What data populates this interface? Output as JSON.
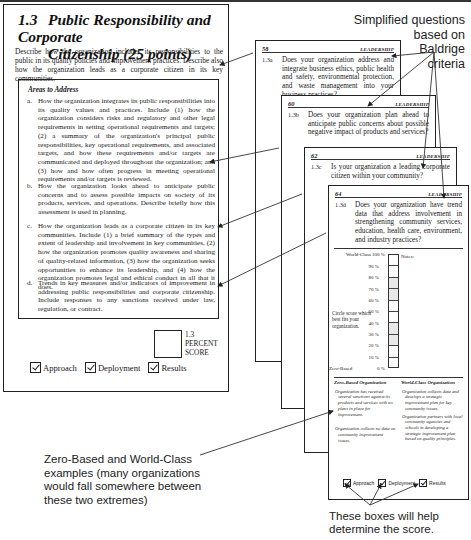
{
  "left_page": {
    "section_number": "1.3",
    "title_line1": "Public Responsibility and Corporate",
    "title_line2": "Citizenship  (25 points)",
    "description": "Describe how the organization includes its responsibilities to the public in its quality policies and improvement practices. Describe also how the organization leads as a corporate citizen in its key communities.",
    "areas_title": "Areas to Address",
    "areas": [
      {
        "letter": "a.",
        "text": "How the organization integrates its public responsibilities into its quality values and practices. Include (1) how the organization considers risks and regulatory and other legal requirements in setting operational requirements and targets; (2) a summary of the organization's principal public responsibilities, key operational requirements, and associated targets, and how these requirements and/or targets are communicated and deployed throughout the organization; and (3) how and how often progress in meeting operational requirements and/or targets is reviewed."
      },
      {
        "letter": "b.",
        "text": "How the organization looks ahead to anticipate public concerns and to assess possible impacts on society of its products, services, and operations. Describe briefly how this assessment is used in planning."
      },
      {
        "letter": "c.",
        "text": "How the organization leads as a corporate citizen in its key communities. Include (1) a brief summary of the types and extent of leadership and involvement in key communities, (2) how the organization promotes quality awareness and sharing of quality-related information, (3) how the organization seeks opportunities to enhance its leadership, and (4) how the organization promotes legal and ethical conduct in all that it does."
      },
      {
        "letter": "d.",
        "text": "Trends in key measures and/or indicators of improvement in addressing public responsibilities and corporate citizenship. Include responses to any sanctions received under law, regulation, or contract."
      }
    ],
    "score_label_line1": "1.3",
    "score_label_line2": "PERCENT",
    "score_label_line3": "SCORE",
    "checks": [
      {
        "label": "Approach",
        "checked": true
      },
      {
        "label": "Deployment",
        "checked": true
      },
      {
        "label": "Results",
        "checked": true
      }
    ]
  },
  "cards": [
    {
      "page": "58",
      "section": "LEADERSHIP",
      "qnum": "1.3a",
      "question": "Does your organization address and integrate business ethics, public health and safety, environmental protection, and waste management into your business practices?"
    },
    {
      "page": "60",
      "section": "LEADERSHIP",
      "qnum": "1.3b",
      "question": "Does your organization plan ahead to anticipate public concerns about possible negative impact of products and services?"
    },
    {
      "page": "62",
      "section": "LEADERSHIP",
      "qnum": "1.3c",
      "question": "Is your organization a leading corporate citizen within your community?"
    },
    {
      "page": "64",
      "section": "LEADERSHIP",
      "qnum": "1.3d",
      "question": "Does your organization have trend data that address involvement in strengthening community services, education, health care, environment, and industry practices?"
    }
  ],
  "scale": {
    "top_label": "World-Class 100 %",
    "bottom_label": "Zero-Based",
    "levels": [
      "100 %",
      "90 %",
      "80 %",
      "70 %",
      "60 %",
      "50 %",
      "40 %",
      "30 %",
      "20 %",
      "10 %",
      "0 %"
    ],
    "notes_label": "Notes:",
    "instruction": "Circle score which best fits your organization."
  },
  "examples": {
    "zero_title": "Zero-Based Organization",
    "zero_items": [
      "Organization has received several sanctions against its products and services with no plans in place for improvement.",
      "Organization collects no data on community improvement issues."
    ],
    "world_title": "World-Class Organization",
    "world_items": [
      "Organization collects data and develops a strategic improvement plan for key community issues.",
      "Organization partners with local community agencies and schools in developing a strategic improvement plan based on quality principles."
    ]
  },
  "card64_checks": [
    {
      "label": "Approach",
      "checked": true
    },
    {
      "label": "Deployment",
      "checked": true
    },
    {
      "label": "Results",
      "checked": true
    }
  ],
  "annotations": {
    "top": [
      "Simplified questions",
      "based on",
      "Baldrige",
      "criteria"
    ],
    "middle": [
      "Zero-Based and World-Class",
      "examples (many organizations",
      "would fall somewhere between",
      "these two extremes)"
    ],
    "bottom": [
      "These boxes will help",
      "determine the score."
    ]
  }
}
